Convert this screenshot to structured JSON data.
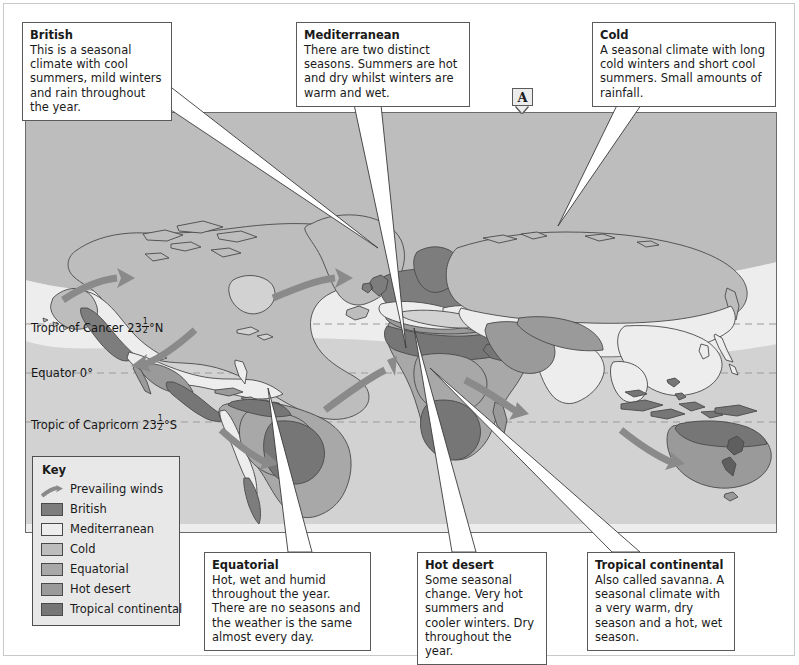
{
  "marker": {
    "label": "A"
  },
  "callouts": [
    {
      "id": "british",
      "title": "British",
      "body": "This is a seasonal climate with cool summers, mild winters and rain throughout the year."
    },
    {
      "id": "mediterranean",
      "title": "Mediterranean",
      "body": "There are two distinct seasons. Summers are hot and dry whilst winters are warm and wet."
    },
    {
      "id": "cold",
      "title": "Cold",
      "body": "A seasonal climate with long cold winters and short cool summers. Small amounts of rainfall."
    },
    {
      "id": "equatorial",
      "title": "Equatorial",
      "body": "Hot, wet and humid throughout the year. There are no seasons and the weather is the same almost every day."
    },
    {
      "id": "hot-desert",
      "title": "Hot desert",
      "body": "Some seasonal change. Very hot summers and cooler winters. Dry throughout the year."
    },
    {
      "id": "tropical-continental",
      "title": "Tropical continental",
      "body": "Also called savanna. A seasonal climate with a very warm, dry season and a hot, wet season."
    }
  ],
  "key": {
    "title": "Key",
    "items": [
      {
        "label": "Prevailing winds",
        "type": "arrow",
        "color": "#8a8a8a"
      },
      {
        "label": "British",
        "type": "swatch",
        "color": "#7d7d7d"
      },
      {
        "label": "Mediterranean",
        "type": "swatch",
        "color": "#ededed"
      },
      {
        "label": "Cold",
        "type": "swatch",
        "color": "#bdbdbd"
      },
      {
        "label": "Equatorial",
        "type": "swatch",
        "color": "#a8a8a8"
      },
      {
        "label": "Hot desert",
        "type": "swatch",
        "color": "#9a9a9a"
      },
      {
        "label": "Tropical continental",
        "type": "swatch",
        "color": "#767676"
      }
    ]
  },
  "latitudes": [
    {
      "id": "cancer",
      "pre": "Tropic of Cancer 23",
      "num": "1",
      "den": "2",
      "post": "°N"
    },
    {
      "id": "equator",
      "pre": "Equator 0",
      "num": "",
      "den": "",
      "post": "°"
    },
    {
      "id": "capricorn",
      "pre": "Tropic of Capricorn 23",
      "num": "1",
      "den": "2",
      "post": "°S"
    }
  ],
  "colors": {
    "ocean": "#d2d2d2",
    "cold": "#bdbdbd",
    "mediterranean": "#ededed",
    "equatorial": "#a8a8a8",
    "hot_desert": "#9a9a9a",
    "british": "#7d7d7d",
    "tropical_continental": "#767676",
    "coast": "#4a4a4a",
    "wind_arrow": "#8a8a8a",
    "grid_line": "#9b9b9b",
    "leader_fill": "#ffffff",
    "leader_stroke": "#3a3a3a",
    "box_border": "#5a5a5a"
  }
}
